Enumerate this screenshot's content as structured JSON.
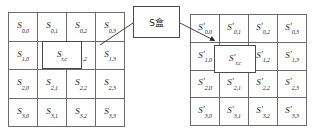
{
  "diagram": {
    "colors": {
      "grid_line": "#6b6b6b",
      "box_border": "#4a4a4a",
      "text": "#1b1b1b",
      "background": "#ffffff",
      "connector": "#2b2b2b"
    }
  },
  "sbox": {
    "label": "S盒",
    "name": "s-box"
  },
  "left_grid": {
    "name": "state-matrix-input",
    "symbol": "S",
    "prime": "",
    "rows": [
      [
        {
          "base": "S",
          "sub": "0,0"
        },
        {
          "base": "S",
          "sub": "0,1"
        },
        {
          "base": "S",
          "sub": "0,2"
        },
        {
          "base": "S",
          "sub": "0,3"
        }
      ],
      [
        {
          "base": "S",
          "sub": "1,0"
        },
        {
          "base": "S",
          "sub": "1,1"
        },
        {
          "base": "S",
          "sub": "1,2"
        },
        {
          "base": "S",
          "sub": "1,3"
        }
      ],
      [
        {
          "base": "S",
          "sub": "2,0"
        },
        {
          "base": "S",
          "sub": "2,1"
        },
        {
          "base": "S",
          "sub": "2,2"
        },
        {
          "base": "S",
          "sub": "2,3"
        }
      ],
      [
        {
          "base": "S",
          "sub": "3,0"
        },
        {
          "base": "S",
          "sub": "3,1"
        },
        {
          "base": "S",
          "sub": "3,2"
        },
        {
          "base": "S",
          "sub": "3,3"
        }
      ]
    ],
    "highlight": {
      "base": "S",
      "sub": "r,c"
    }
  },
  "right_grid": {
    "name": "state-matrix-output",
    "symbol": "S'",
    "prime": "′",
    "rows": [
      [
        {
          "base": "S",
          "sub": "0,0"
        },
        {
          "base": "S",
          "sub": "0,1"
        },
        {
          "base": "S",
          "sub": "0,2"
        },
        {
          "base": "S",
          "sub": "0,3"
        }
      ],
      [
        {
          "base": "S",
          "sub": "1,0"
        },
        {
          "base": "S",
          "sub": "1,1"
        },
        {
          "base": "S",
          "sub": "1,2"
        },
        {
          "base": "S",
          "sub": "1,3"
        }
      ],
      [
        {
          "base": "S",
          "sub": "2,0"
        },
        {
          "base": "S",
          "sub": "2,1"
        },
        {
          "base": "S",
          "sub": "2,2"
        },
        {
          "base": "S",
          "sub": "2,3"
        }
      ],
      [
        {
          "base": "S",
          "sub": "3,0"
        },
        {
          "base": "S",
          "sub": "3,1"
        },
        {
          "base": "S",
          "sub": "3,2"
        },
        {
          "base": "S",
          "sub": "3,3"
        }
      ]
    ],
    "highlight": {
      "base": "S",
      "sub": "r,c"
    }
  }
}
